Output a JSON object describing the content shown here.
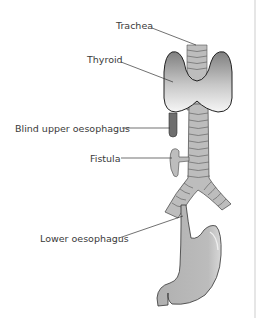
{
  "diagram": {
    "labels": [
      {
        "id": "trachea",
        "text": "Trachea"
      },
      {
        "id": "thyroid",
        "text": "Thyroid"
      },
      {
        "id": "blind_upper",
        "text": "Blind upper oesophagus"
      },
      {
        "id": "fistula",
        "text": "Fistula"
      },
      {
        "id": "lower",
        "text": "Lower oesophagus"
      }
    ],
    "colors": {
      "outline": "#2b2b2b",
      "tissue_fill": "#b4b4b4",
      "trachea_fill": "#bdbdbd",
      "ring_line": "#6a6a6a",
      "thyroid_top": "#8a8a8a",
      "thyroid_bottom": "#f2f2f2",
      "pouch_fill": "#6e6e6e",
      "leader_line": "#333333",
      "divider": "#e6e6e6"
    }
  }
}
